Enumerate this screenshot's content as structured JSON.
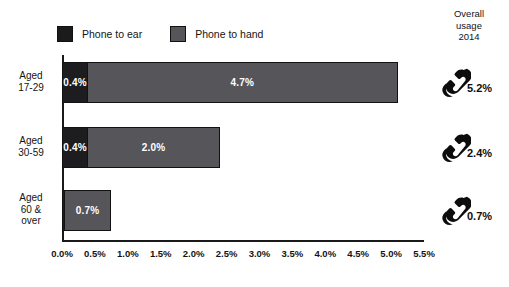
{
  "legend": {
    "items": [
      {
        "label": "Phone to ear",
        "color": "#1d1d1f",
        "icon": "legend-swatch-dark"
      },
      {
        "label": "Phone to hand",
        "color": "#56565a",
        "icon": "legend-swatch-gray"
      }
    ]
  },
  "overall_header": {
    "line1": "Overall",
    "line2": "usage",
    "line3": "2014"
  },
  "overall_rows": [
    {
      "value": "5.2%",
      "icon": "telephone-handset-icon"
    },
    {
      "value": "2.4%",
      "icon": "telephone-handset-icon"
    },
    {
      "value": "0.7%",
      "icon": "telephone-handset-icon"
    }
  ],
  "categories_display": [
    {
      "line1": "Aged",
      "line2": "17-29",
      "line3": ""
    },
    {
      "line1": "Aged",
      "line2": "30-59",
      "line3": ""
    },
    {
      "line1": "Aged",
      "line2": "60 &",
      "line3": "over"
    }
  ],
  "chart_data": {
    "type": "bar",
    "orientation": "horizontal",
    "stacked": true,
    "title": "",
    "subtitle": "",
    "xlabel": "",
    "ylabel": "",
    "xlim": [
      0.0,
      5.5
    ],
    "xunit": "%",
    "grid": false,
    "legend_position": "top-left",
    "categories": [
      "Aged 17-29",
      "Aged 30-59",
      "Aged 60 & over"
    ],
    "tick_labels": [
      "0.0%",
      "0.5%",
      "1.0%",
      "1.5%",
      "2.0%",
      "2.5%",
      "3.0%",
      "3.5%",
      "4.0%",
      "4.5%",
      "5.0%",
      "5.5%"
    ],
    "tick_values": [
      0.0,
      0.5,
      1.0,
      1.5,
      2.0,
      2.5,
      3.0,
      3.5,
      4.0,
      4.5,
      5.0,
      5.5
    ],
    "series": [
      {
        "name": "Phone to ear",
        "color": "#1d1d1f",
        "values": [
          0.4,
          0.4,
          0.05
        ],
        "labels": [
          "0.4%",
          "0.4%",
          ""
        ]
      },
      {
        "name": "Phone to hand",
        "color": "#56565a",
        "values": [
          4.7,
          2.0,
          0.7
        ],
        "labels": [
          "4.7%",
          "2.0%",
          "0.7%"
        ]
      }
    ],
    "totals": [
      5.2,
      2.4,
      0.7
    ],
    "annotations": {
      "overall_usage_2014": [
        "5.2%",
        "2.4%",
        "0.7%"
      ]
    }
  }
}
